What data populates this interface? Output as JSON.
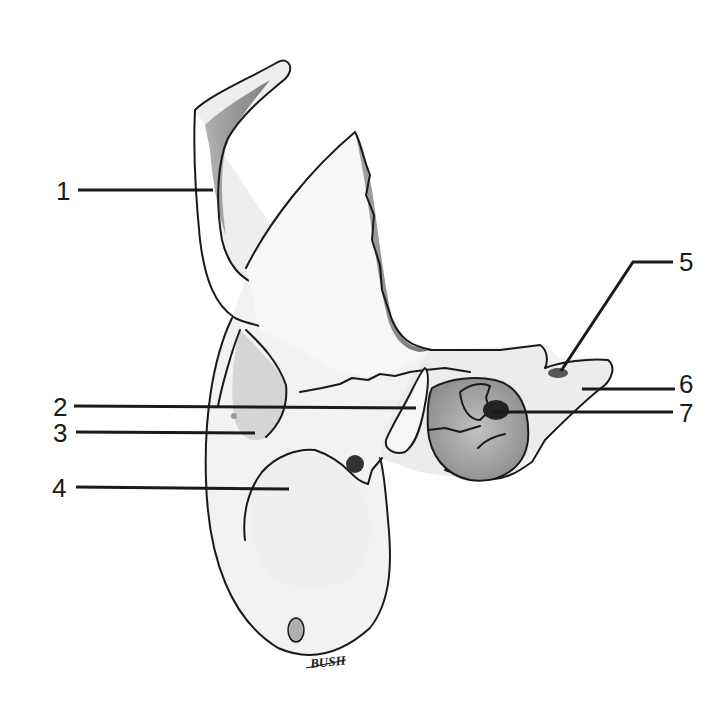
{
  "figure": {
    "type": "anatomical-illustration",
    "background": "#ffffff",
    "line_color": "#1a1a1a",
    "shade_light": "#e8e8e8",
    "shade_mid": "#b5b5b5",
    "shade_dark": "#5a5a5a"
  },
  "labels": [
    {
      "id": "1",
      "text": "1",
      "x": 64,
      "y": 190,
      "line": [
        [
          78,
          190
        ],
        [
          213,
          190
        ]
      ]
    },
    {
      "id": "2",
      "text": "2",
      "x": 62,
      "y": 407,
      "line": [
        [
          74,
          406
        ],
        [
          416,
          408
        ]
      ]
    },
    {
      "id": "3",
      "text": "3",
      "x": 62,
      "y": 433,
      "line": [
        [
          76,
          432
        ],
        [
          255,
          433
        ]
      ]
    },
    {
      "id": "4",
      "text": "4",
      "x": 62,
      "y": 487,
      "line": [
        [
          76,
          487
        ],
        [
          289,
          489
        ]
      ]
    },
    {
      "id": "5",
      "text": "5",
      "x": 686,
      "y": 262,
      "line": [
        [
          673,
          262
        ],
        [
          633,
          262
        ],
        [
          561,
          371
        ]
      ]
    },
    {
      "id": "6",
      "text": "6",
      "x": 686,
      "y": 384,
      "line": [
        [
          675,
          389
        ],
        [
          582,
          389
        ]
      ]
    },
    {
      "id": "7",
      "text": "7",
      "x": 686,
      "y": 413,
      "line": [
        [
          673,
          412
        ],
        [
          492,
          412
        ]
      ]
    }
  ],
  "signature": {
    "text": "BUSH",
    "x": 313,
    "y": 663
  }
}
